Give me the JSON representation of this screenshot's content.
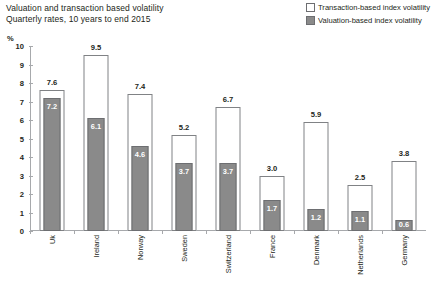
{
  "title": {
    "line1": "Valuation and transaction based volatility",
    "line2": "Quarterly rates, 10 years to end 2015"
  },
  "legend": {
    "items": [
      {
        "label": "Transaction-based index volatility",
        "style": "open",
        "color": "#ffffff"
      },
      {
        "label": "Valuation-based index volatility",
        "style": "filled",
        "color": "#8a8a8a"
      }
    ]
  },
  "axis": {
    "unit": "%",
    "yticks": [
      "0",
      "1",
      "2",
      "3",
      "4",
      "5",
      "6",
      "7",
      "8",
      "9",
      "10"
    ]
  },
  "chart_data": {
    "type": "bar",
    "title": "Valuation and transaction based volatility",
    "subtitle": "Quarterly rates, 10 years to end 2015",
    "xlabel": "",
    "ylabel": "%",
    "ylim": [
      0,
      10
    ],
    "grid": false,
    "legend_position": "top-right",
    "categories": [
      "Uk",
      "Ireland",
      "Norway",
      "Sweden",
      "Switzerland",
      "France",
      "Denmark",
      "Netherlands",
      "Germany"
    ],
    "series": [
      {
        "name": "Transaction-based index volatility",
        "color": "#ffffff",
        "values": [
          7.6,
          9.5,
          7.4,
          5.2,
          6.7,
          3.0,
          5.9,
          2.5,
          3.8
        ],
        "labels": [
          "7.6",
          "9.5",
          "7.4",
          "5.2",
          "6.7",
          "3.0",
          "5.9",
          "2.5",
          "3.8"
        ]
      },
      {
        "name": "Valuation-based index volatility",
        "color": "#8a8a8a",
        "values": [
          7.2,
          6.1,
          4.6,
          3.7,
          3.7,
          1.7,
          1.2,
          1.1,
          0.6
        ],
        "labels": [
          "7.2",
          "6.1",
          "4.6",
          "3.7",
          "3.7",
          "1.7",
          "1.2",
          "1.1",
          "0.6"
        ]
      }
    ]
  }
}
